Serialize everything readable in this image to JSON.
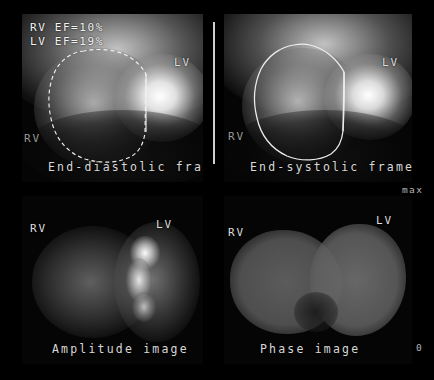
{
  "study": {
    "modality": "gated-blood-pool-scintigraphy",
    "ef_measurements": [
      {
        "chamber": "RV",
        "label": "RV EF=10%"
      },
      {
        "chamber": "LV",
        "label": "LV EF=19%"
      }
    ]
  },
  "panels": [
    {
      "id": "end-diastolic",
      "caption": "End-diastolic frame",
      "labels": {
        "rv": "RV",
        "lv": "LV"
      }
    },
    {
      "id": "end-systolic",
      "caption": "End-systolic frame",
      "labels": {
        "rv": "RV",
        "lv": "LV"
      }
    },
    {
      "id": "amplitude",
      "caption": "Amplitude image",
      "labels": {
        "rv": "RV",
        "lv": "LV"
      }
    },
    {
      "id": "phase",
      "caption": "Phase image",
      "labels": {
        "rv": "RV",
        "lv": "LV"
      }
    }
  ],
  "scale": {
    "max_label": "max",
    "min_label": "0"
  },
  "colors": {
    "background": "#000000",
    "roi_contour": "#f2f2f2",
    "text": "#e8e8e8",
    "divider": "#cfcfcf"
  }
}
